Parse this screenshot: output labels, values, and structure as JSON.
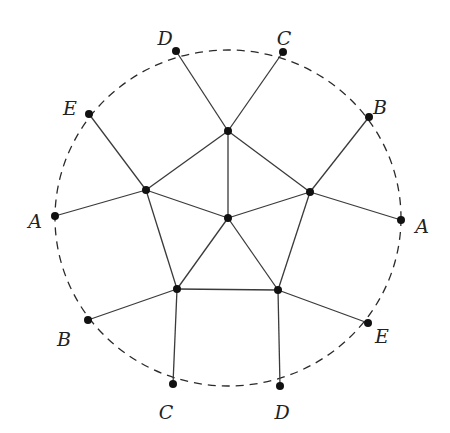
{
  "diagram": {
    "boundary": {
      "cx": 228,
      "cy": 218,
      "rx": 173,
      "ry": 168,
      "style": "dashed"
    },
    "inner_nodes": [
      {
        "id": "top",
        "x": 228,
        "y": 131
      },
      {
        "id": "left",
        "x": 146,
        "y": 190
      },
      {
        "id": "right",
        "x": 310,
        "y": 192
      },
      {
        "id": "center",
        "x": 228,
        "y": 218
      },
      {
        "id": "bottom-left",
        "x": 177,
        "y": 289
      },
      {
        "id": "bottom-right",
        "x": 278,
        "y": 290
      }
    ],
    "outer_nodes": [
      {
        "id": "D-top",
        "label": "D",
        "x": 176,
        "y": 51,
        "lx": 165,
        "ly": 40
      },
      {
        "id": "C-top",
        "label": "C",
        "x": 283,
        "y": 52,
        "lx": 284,
        "ly": 40
      },
      {
        "id": "E-left",
        "label": "E",
        "x": 89,
        "y": 114,
        "lx": 70,
        "ly": 110
      },
      {
        "id": "B-right",
        "label": "B",
        "x": 369,
        "y": 117,
        "lx": 380,
        "ly": 109
      },
      {
        "id": "A-left",
        "label": "A",
        "x": 55,
        "y": 216,
        "lx": 35,
        "ly": 223
      },
      {
        "id": "A-right",
        "label": "A",
        "x": 401,
        "y": 220,
        "lx": 422,
        "ly": 228
      },
      {
        "id": "B-left",
        "label": "B",
        "x": 88,
        "y": 320,
        "lx": 64,
        "ly": 341
      },
      {
        "id": "E-right",
        "label": "E",
        "x": 368,
        "y": 323,
        "lx": 382,
        "ly": 338
      },
      {
        "id": "C-bottom",
        "label": "C",
        "x": 173,
        "y": 384,
        "lx": 166,
        "ly": 414
      },
      {
        "id": "D-bottom",
        "label": "D",
        "x": 280,
        "y": 386,
        "lx": 282,
        "ly": 414
      }
    ],
    "edges": [
      [
        "top",
        "left"
      ],
      [
        "top",
        "right"
      ],
      [
        "top",
        "center"
      ],
      [
        "left",
        "center"
      ],
      [
        "right",
        "center"
      ],
      [
        "left",
        "bottom-left"
      ],
      [
        "right",
        "bottom-right"
      ],
      [
        "center",
        "bottom-left"
      ],
      [
        "center",
        "bottom-right"
      ],
      [
        "bottom-left",
        "bottom-right"
      ],
      [
        "top",
        "D-top"
      ],
      [
        "top",
        "C-top"
      ],
      [
        "left",
        "E-left"
      ],
      [
        "left",
        "A-left"
      ],
      [
        "right",
        "B-right"
      ],
      [
        "right",
        "A-right"
      ],
      [
        "bottom-left",
        "B-left"
      ],
      [
        "bottom-left",
        "C-bottom"
      ],
      [
        "bottom-right",
        "E-right"
      ],
      [
        "bottom-right",
        "D-bottom"
      ]
    ],
    "labels": [
      "D",
      "C",
      "E",
      "B",
      "A",
      "A",
      "B",
      "E",
      "C",
      "D"
    ]
  }
}
